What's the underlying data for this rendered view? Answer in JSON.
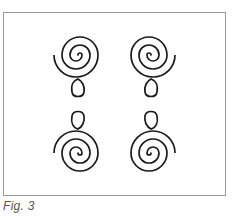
{
  "figure": {
    "caption": "Fig. 3",
    "stroke_color": "#1a1a1a",
    "frame_color": "#9a9a9a",
    "elements": [
      {
        "name": "spiral-top-left",
        "cx": 78,
        "cy": 55,
        "loop": "below"
      },
      {
        "name": "spiral-top-right",
        "cx": 151,
        "cy": 55,
        "loop": "below"
      },
      {
        "name": "spiral-bottom-left",
        "cx": 78,
        "cy": 153,
        "loop": "above"
      },
      {
        "name": "spiral-bottom-right",
        "cx": 151,
        "cy": 153,
        "loop": "above"
      }
    ]
  }
}
